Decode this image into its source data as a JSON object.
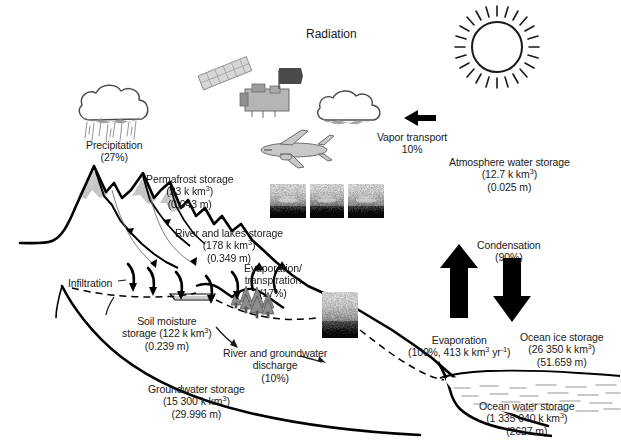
{
  "figure": {
    "title": "Radiation",
    "title_pos": {
      "x": 306,
      "y": 27
    }
  },
  "labels": [
    {
      "name": "precipitation",
      "lines": [
        "Precipitation",
        "(27%)"
      ],
      "x": 114,
      "y": 139,
      "align": "center"
    },
    {
      "name": "permafrost-storage",
      "lines": [
        "Permafrost storage",
        "(23 k km<sup>3</sup>)",
        "(0.043 m)"
      ],
      "x": 190,
      "y": 173,
      "align": "center"
    },
    {
      "name": "river-and-lakes-storage",
      "lines": [
        "River and lakes storage",
        "(178 k km<sup>3</sup>)",
        "(0.349 m)"
      ],
      "x": 229,
      "y": 227,
      "align": "center"
    },
    {
      "name": "infiltration",
      "lines": [
        "Infiltration"
      ],
      "x": 90,
      "y": 277,
      "align": "center"
    },
    {
      "name": "soil-moisture-storage",
      "lines": [
        "Soil moisture",
        "storage (122 k km<sup>3</sup>)",
        "(0.239 m)"
      ],
      "x": 167,
      "y": 315,
      "align": "center"
    },
    {
      "name": "evaporation-transpiration",
      "lines": [
        "Evaporation/",
        "transpiration",
        "(17%)"
      ],
      "x": 273,
      "y": 262,
      "align": "center"
    },
    {
      "name": "river-and-groundwater-discharge",
      "lines": [
        "River and groundwater",
        "discharge",
        "(10%)"
      ],
      "x": 275,
      "y": 347,
      "align": "center"
    },
    {
      "name": "groundwater-storage",
      "lines": [
        "Groundwater storage",
        "(15 300 k km<sup>3</sup>)",
        "(29.996 m)"
      ],
      "x": 196,
      "y": 383,
      "align": "center"
    },
    {
      "name": "vapor-transport",
      "lines": [
        "Vapor transport",
        "10%"
      ],
      "x": 412,
      "y": 131,
      "align": "center"
    },
    {
      "name": "atmosphere-water-storage",
      "lines": [
        "Atmosphere water storage",
        "(12.7 k km<sup>3</sup>)",
        "(0.025 m)"
      ],
      "x": 509,
      "y": 156,
      "align": "center"
    },
    {
      "name": "condensation",
      "lines": [
        "Condensation",
        "(90%)"
      ],
      "x": 509,
      "y": 239,
      "align": "center"
    },
    {
      "name": "evaporation",
      "lines": [
        "Evaporation",
        "(100%, 413 k km<sup>3</sup> yr<sup>-1</sup>)"
      ],
      "x": 459,
      "y": 334,
      "align": "center"
    },
    {
      "name": "ocean-ice-storage",
      "lines": [
        "Ocean ice storage",
        "(26 350 k km<sup>3</sup>)",
        "(51.659 m)"
      ],
      "x": 562,
      "y": 331,
      "align": "center"
    },
    {
      "name": "ocean-water-storage",
      "lines": [
        "Ocean water storage",
        "(1 335 040 k km<sup>3</sup>)",
        "(2627 m)"
      ],
      "x": 527,
      "y": 400,
      "align": "center"
    }
  ],
  "chart_data": {
    "type": "diagram",
    "flux_unit_note": "Percentages are relative to ocean evaporation (100% = 413 k km3 yr-1)",
    "fluxes": [
      {
        "name": "Radiation",
        "value": null,
        "unit": "",
        "label": "Radiation"
      },
      {
        "name": "Precipitation",
        "value": 27,
        "unit": "%",
        "label": "(27%)"
      },
      {
        "name": "Vapor transport",
        "value": 10,
        "unit": "%",
        "label": "10%"
      },
      {
        "name": "Condensation",
        "value": 90,
        "unit": "%",
        "label": "(90%)"
      },
      {
        "name": "Evaporation",
        "value": 100,
        "unit": "%",
        "volume": 413,
        "volume_unit": "k km3 yr-1",
        "label": "(100%, 413 k km3 yr-1)"
      },
      {
        "name": "Evaporation/transpiration",
        "value": 17,
        "unit": "%",
        "label": "(17%)"
      },
      {
        "name": "River and groundwater discharge",
        "value": 10,
        "unit": "%",
        "label": "(10%)"
      },
      {
        "name": "Infiltration",
        "value": null,
        "unit": "",
        "label": "Infiltration"
      }
    ],
    "storages": [
      {
        "name": "Permafrost storage",
        "volume": 23,
        "volume_unit": "k km3",
        "depth": 0.043,
        "depth_unit": "m"
      },
      {
        "name": "River and lakes storage",
        "volume": 178,
        "volume_unit": "k km3",
        "depth": 0.349,
        "depth_unit": "m"
      },
      {
        "name": "Soil moisture storage",
        "volume": 122,
        "volume_unit": "k km3",
        "depth": 0.239,
        "depth_unit": "m"
      },
      {
        "name": "Groundwater storage",
        "volume": 15300,
        "volume_unit": "k km3",
        "depth": 29.996,
        "depth_unit": "m"
      },
      {
        "name": "Atmosphere water storage",
        "volume": 12.7,
        "volume_unit": "k km3",
        "depth": 0.025,
        "depth_unit": "m"
      },
      {
        "name": "Ocean ice storage",
        "volume": 26350,
        "volume_unit": "k km3",
        "depth": 51.659,
        "depth_unit": "m"
      },
      {
        "name": "Ocean water storage",
        "volume": 1335040,
        "volume_unit": "k km3",
        "depth": 2627,
        "depth_unit": "m"
      }
    ],
    "colors": {
      "ink": "#1a1a1a",
      "snow_fill": "#c9c9c9",
      "cloud_fill": "#ffffff",
      "cloud_shadow": "#9a9a9a",
      "ocean_dash": "#b4b4b4",
      "background": "#ffffff"
    }
  },
  "icons": {
    "sun": "sun-icon",
    "cloud_precip": "rain-cloud-icon",
    "cloud_vapor": "cloud-icon",
    "satellite": "satellite-icon",
    "aircraft": "aircraft-icon",
    "trees": "conifer-trees-icon",
    "arrow_up": "up-arrow-icon",
    "arrow_down": "down-arrow-icon",
    "arrow_left": "left-arrow-icon"
  },
  "photos": [
    {
      "name": "photo-inset-aircraft-1",
      "x": 270,
      "y": 184,
      "w": 36,
      "h": 34,
      "seed": 11,
      "dark": 0.42
    },
    {
      "name": "photo-inset-aircraft-2",
      "x": 310,
      "y": 184,
      "w": 34,
      "h": 34,
      "seed": 29,
      "dark": 0.5
    },
    {
      "name": "photo-inset-aircraft-3",
      "x": 348,
      "y": 184,
      "w": 36,
      "h": 34,
      "seed": 47,
      "dark": 0.38
    },
    {
      "name": "photo-inset-landscape",
      "x": 322,
      "y": 292,
      "w": 36,
      "h": 46,
      "seed": 73,
      "dark": 0.22
    }
  ]
}
